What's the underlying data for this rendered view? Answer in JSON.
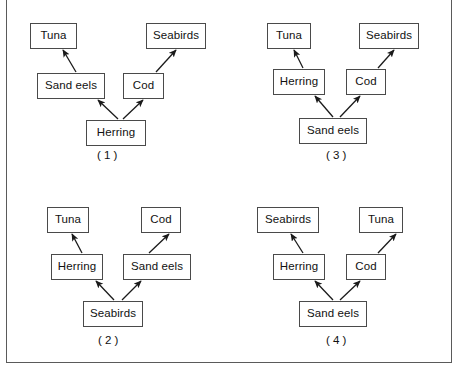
{
  "figure": {
    "type": "food-web-multiple-choice",
    "panel_count": 4,
    "border_color": "#5a5a5a",
    "box_border_color": "#4a4a4a",
    "arrow_color": "#1a1a1a",
    "background": "#ffffff"
  },
  "panels": [
    {
      "id": "panel-1",
      "label": "( 1 )",
      "label_x": 96,
      "label_y": 148,
      "origin_x": 0,
      "origin_y": 0,
      "nodes": [
        {
          "name": "Tuna",
          "text": "Tuna",
          "x": 29,
          "y": 22,
          "w": 47,
          "h": 26
        },
        {
          "name": "Seabirds",
          "text": "Seabirds",
          "x": 145,
          "y": 22,
          "w": 60,
          "h": 26
        },
        {
          "name": "Sand eels",
          "text": "Sand eels",
          "x": 36,
          "y": 72,
          "w": 68,
          "h": 26
        },
        {
          "name": "Cod",
          "text": "Cod",
          "x": 122,
          "y": 72,
          "w": 41,
          "h": 26
        },
        {
          "name": "Herring",
          "text": "Herring",
          "x": 85,
          "y": 119,
          "w": 60,
          "h": 26
        }
      ],
      "arrows": [
        {
          "from": "Sand eels",
          "to": "Tuna",
          "x1": 70,
          "y1": 72,
          "x2": 57,
          "y2": 50
        },
        {
          "from": "Cod",
          "to": "Seabirds",
          "x1": 150,
          "y1": 72,
          "x2": 170,
          "y2": 50
        },
        {
          "from": "Herring",
          "to": "Sand eels",
          "x1": 112,
          "y1": 119,
          "x2": 92,
          "y2": 100
        },
        {
          "from": "Herring",
          "to": "Cod",
          "x1": 117,
          "y1": 119,
          "x2": 137,
          "y2": 100
        }
      ]
    },
    {
      "id": "panel-3",
      "label": "( 3 )",
      "label_x": 325,
      "label_y": 148,
      "origin_x": 0,
      "origin_y": 0,
      "nodes": [
        {
          "name": "Tuna",
          "text": "Tuna",
          "x": 266,
          "y": 22,
          "w": 44,
          "h": 26
        },
        {
          "name": "Seabirds",
          "text": "Seabirds",
          "x": 358,
          "y": 22,
          "w": 60,
          "h": 26
        },
        {
          "name": "Herring",
          "text": "Herring",
          "x": 272,
          "y": 68,
          "w": 52,
          "h": 26
        },
        {
          "name": "Cod",
          "text": "Cod",
          "x": 345,
          "y": 68,
          "w": 40,
          "h": 26
        },
        {
          "name": "Sand eels",
          "text": "Sand eels",
          "x": 298,
          "y": 117,
          "w": 68,
          "h": 26
        }
      ],
      "arrows": [
        {
          "from": "Herring",
          "to": "Tuna",
          "x1": 297,
          "y1": 68,
          "x2": 288,
          "y2": 50
        },
        {
          "from": "Cod",
          "to": "Seabirds",
          "x1": 372,
          "y1": 68,
          "x2": 388,
          "y2": 50
        },
        {
          "from": "Sand eels",
          "to": "Herring",
          "x1": 327,
          "y1": 117,
          "x2": 309,
          "y2": 96
        },
        {
          "from": "Sand eels",
          "to": "Cod",
          "x1": 334,
          "y1": 117,
          "x2": 354,
          "y2": 96
        }
      ]
    },
    {
      "id": "panel-2",
      "label": "( 2 )",
      "label_x": 97,
      "label_y": 333,
      "origin_x": 0,
      "origin_y": 0,
      "nodes": [
        {
          "name": "Tuna",
          "text": "Tuna",
          "x": 46,
          "y": 206,
          "w": 42,
          "h": 26
        },
        {
          "name": "Cod",
          "text": "Cod",
          "x": 140,
          "y": 206,
          "w": 40,
          "h": 26
        },
        {
          "name": "Herring",
          "text": "Herring",
          "x": 50,
          "y": 253,
          "w": 52,
          "h": 26
        },
        {
          "name": "Sand eels",
          "text": "Sand eels",
          "x": 122,
          "y": 253,
          "w": 68,
          "h": 26
        },
        {
          "name": "Seabirds",
          "text": "Seabirds",
          "x": 82,
          "y": 300,
          "w": 60,
          "h": 26
        }
      ],
      "arrows": [
        {
          "from": "Herring",
          "to": "Tuna",
          "x1": 76,
          "y1": 253,
          "x2": 66,
          "y2": 234
        },
        {
          "from": "Sand eels",
          "to": "Cod",
          "x1": 143,
          "y1": 253,
          "x2": 163,
          "y2": 234
        },
        {
          "from": "Seabirds",
          "to": "Herring",
          "x1": 108,
          "y1": 300,
          "x2": 90,
          "y2": 281
        },
        {
          "from": "Seabirds",
          "to": "Sand eels",
          "x1": 116,
          "y1": 300,
          "x2": 135,
          "y2": 281
        }
      ]
    },
    {
      "id": "panel-4",
      "label": "( 4 )",
      "label_x": 325,
      "label_y": 333,
      "origin_x": 0,
      "origin_y": 0,
      "nodes": [
        {
          "name": "Seabirds",
          "text": "Seabirds",
          "x": 256,
          "y": 206,
          "w": 62,
          "h": 26
        },
        {
          "name": "Tuna",
          "text": "Tuna",
          "x": 358,
          "y": 206,
          "w": 44,
          "h": 26
        },
        {
          "name": "Herring",
          "text": "Herring",
          "x": 272,
          "y": 253,
          "w": 52,
          "h": 26
        },
        {
          "name": "Cod",
          "text": "Cod",
          "x": 345,
          "y": 253,
          "w": 40,
          "h": 26
        },
        {
          "name": "Sand eels",
          "text": "Sand eels",
          "x": 298,
          "y": 300,
          "w": 68,
          "h": 26
        }
      ],
      "arrows": [
        {
          "from": "Herring",
          "to": "Seabirds",
          "x1": 297,
          "y1": 253,
          "x2": 285,
          "y2": 234
        },
        {
          "from": "Cod",
          "to": "Tuna",
          "x1": 372,
          "y1": 253,
          "x2": 390,
          "y2": 234
        },
        {
          "from": "Sand eels",
          "to": "Herring",
          "x1": 327,
          "y1": 300,
          "x2": 309,
          "y2": 281
        },
        {
          "from": "Sand eels",
          "to": "Cod",
          "x1": 334,
          "y1": 300,
          "x2": 354,
          "y2": 281
        }
      ]
    }
  ]
}
